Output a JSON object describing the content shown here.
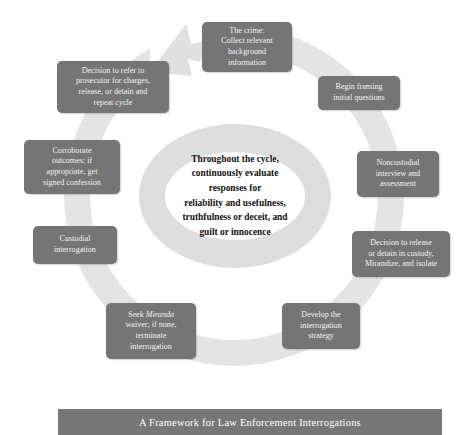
{
  "figure": {
    "caption": "A Framework for Law Enforcement Interrogations",
    "center_lines": [
      "Throughout the cycle,",
      "continuously evaluate",
      "responses for",
      "reliability and usefulness,",
      "truthfulness or deceit, and",
      "guilt or innocence"
    ]
  },
  "colors": {
    "node_fill": "#757575",
    "node_text": "#f2f2f2",
    "ring_fill": "#e4e4e4",
    "inner_ring_fill": "#dadada",
    "inner_core_fill": "#ffffff",
    "caption_fill": "#777777",
    "caption_text": "#ffffff",
    "page_background": "#ffffff"
  },
  "cycle": {
    "direction": "clockwise",
    "arrowhead_position": "top-left-gap",
    "nodes": [
      {
        "id": "crime",
        "order": 1,
        "lines": [
          "The crime:",
          "Collect relevant",
          "background",
          "information"
        ]
      },
      {
        "id": "framing",
        "order": 2,
        "lines": [
          "Begin framing",
          "initial questions"
        ]
      },
      {
        "id": "noncustodial",
        "order": 3,
        "lines": [
          "Noncustodial",
          "interview and",
          "assessment"
        ]
      },
      {
        "id": "release-detain",
        "order": 4,
        "lines": [
          "Decision to release",
          "or detain in custody,",
          "Mirandize, and isolate"
        ]
      },
      {
        "id": "strategy",
        "order": 5,
        "lines": [
          "Develop the",
          "interrogation",
          "strategy"
        ]
      },
      {
        "id": "miranda-waiver",
        "order": 6,
        "lines": [
          "Seek Miranda",
          "waiver; if none,",
          "terminate",
          "interrogation"
        ],
        "italic_word": "Miranda"
      },
      {
        "id": "custodial",
        "order": 7,
        "lines": [
          "Custodial",
          "interrogation"
        ]
      },
      {
        "id": "corroborate",
        "order": 8,
        "lines": [
          "Corroborate",
          "outcomes; if",
          "appropriate, get",
          "signed confession"
        ]
      },
      {
        "id": "refer",
        "order": 9,
        "lines": [
          "Decision to refer to",
          "prosecutor for charges,",
          "release, or detain and",
          "repeat cycle"
        ]
      }
    ]
  }
}
